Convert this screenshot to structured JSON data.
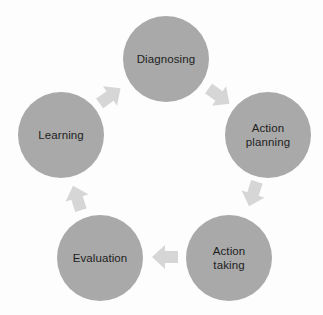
{
  "diagram": {
    "type": "cycle",
    "colors": {
      "background": "#fdfdfd",
      "node_fill": "#a9a9a9",
      "node_text": "#1e1e1e",
      "arrow_fill": "#d6d6d6"
    },
    "nodes": [
      {
        "id": "diagnosing",
        "label": "Diagnosing",
        "cx": 166,
        "cy": 59
      },
      {
        "id": "action-planning",
        "label": "Action\nplanning",
        "cx": 268,
        "cy": 135
      },
      {
        "id": "action-taking",
        "label": "Action\ntaking",
        "cx": 229,
        "cy": 258
      },
      {
        "id": "evaluation",
        "label": "Evaluation",
        "cx": 100,
        "cy": 258
      },
      {
        "id": "learning",
        "label": "Learning",
        "cx": 61,
        "cy": 135
      }
    ],
    "arrows": [
      {
        "from": "diagnosing",
        "to": "action-planning",
        "cx": 219,
        "cy": 96,
        "angle": 36
      },
      {
        "from": "action-planning",
        "to": "action-taking",
        "cx": 253,
        "cy": 194,
        "angle": 108
      },
      {
        "from": "action-taking",
        "to": "evaluation",
        "cx": 165,
        "cy": 257,
        "angle": 180
      },
      {
        "from": "evaluation",
        "to": "learning",
        "cx": 77,
        "cy": 198,
        "angle": 252
      },
      {
        "from": "learning",
        "to": "diagnosing",
        "cx": 110,
        "cy": 96,
        "angle": 324
      }
    ]
  }
}
